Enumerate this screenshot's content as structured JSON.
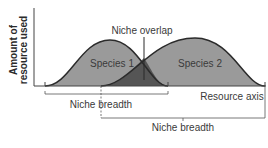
{
  "diagram": {
    "y_axis_label_line1": "Amount of",
    "y_axis_label_line2": "resource used",
    "x_axis_label": "Resource axis",
    "species1_label": "Species 1",
    "species2_label": "Species 2",
    "overlap_label": "Niche overlap",
    "breadth1_label": "Niche breadth",
    "breadth2_label": "Niche breadth",
    "colors": {
      "species_fill": "#9a9a9a",
      "overlap_fill": "#555555",
      "curve_stroke": "#2b2b2b",
      "axis": "#444444",
      "text": "#3a3a3a"
    }
  }
}
